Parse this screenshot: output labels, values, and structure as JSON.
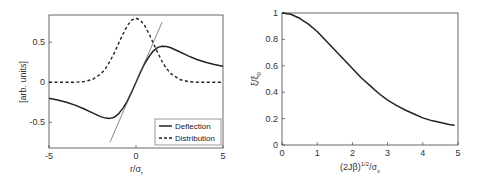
{
  "chart_data": [
    {
      "type": "line",
      "title": "",
      "xlabel": "r/σ_r",
      "xlabel_main": "r/σ",
      "xlabel_sub": "r",
      "ylabel": "[arb. units]",
      "xlim": [
        -5,
        5
      ],
      "ylim": [
        -0.82,
        0.84
      ],
      "xticks": [
        -5,
        0,
        5
      ],
      "xtick_labels": [
        "-5",
        "0",
        "5"
      ],
      "yticks": [
        -0.5,
        0,
        0.5
      ],
      "ytick_labels": [
        "-0.5",
        "0",
        "0.5"
      ],
      "grid": false,
      "legend_position": "bottom-right",
      "series": [
        {
          "name": "Deflection",
          "style": "solid",
          "color": "#222222",
          "x": [
            -5,
            -4.5,
            -4,
            -3.5,
            -3,
            -2.5,
            -2,
            -1.75,
            -1.5,
            -1.25,
            -1,
            -0.75,
            -0.5,
            -0.25,
            0,
            0.25,
            0.5,
            0.75,
            1,
            1.25,
            1.5,
            1.75,
            2,
            2.5,
            3,
            3.5,
            4,
            4.5,
            5
          ],
          "y": [
            -0.2,
            -0.222,
            -0.25,
            -0.284,
            -0.33,
            -0.382,
            -0.432,
            -0.447,
            -0.451,
            -0.435,
            -0.393,
            -0.322,
            -0.235,
            -0.124,
            0,
            0.124,
            0.235,
            0.322,
            0.393,
            0.435,
            0.451,
            0.447,
            0.432,
            0.382,
            0.33,
            0.284,
            0.25,
            0.222,
            0.2
          ]
        },
        {
          "name": "Distribution",
          "style": "dashed",
          "color": "#222222",
          "x": [
            -5,
            -4,
            -3.5,
            -3,
            -2.5,
            -2,
            -1.75,
            -1.5,
            -1.25,
            -1,
            -0.75,
            -0.5,
            -0.25,
            0,
            0.25,
            0.5,
            0.75,
            1,
            1.25,
            1.5,
            1.75,
            2,
            2.5,
            3,
            3.5,
            4,
            5
          ],
          "y": [
            0,
            0.0003,
            0.0017,
            0.0089,
            0.0351,
            0.1083,
            0.1735,
            0.2596,
            0.3664,
            0.4852,
            0.6031,
            0.706,
            0.7753,
            0.8,
            0.7753,
            0.706,
            0.6031,
            0.4852,
            0.3664,
            0.2596,
            0.1735,
            0.1083,
            0.0351,
            0.0089,
            0.0017,
            0.0003,
            0
          ]
        },
        {
          "name": "Tangent",
          "style": "thin",
          "color": "#555555",
          "x": [
            -1.5,
            1.5
          ],
          "y": [
            -0.75,
            0.75
          ],
          "in_legend": false
        }
      ],
      "legend": [
        "Deflection",
        "Distribution"
      ]
    },
    {
      "type": "line",
      "title": "",
      "xlabel": "(2Jβ)^{1/2}/σ_x",
      "xlabel_main": "(2Jβ)",
      "xlabel_sup": "1/2",
      "xlabel_tail": "/σ",
      "xlabel_sub": "x",
      "ylabel": "ξ/ξ_0",
      "ylabel_main": "ξ/ξ",
      "ylabel_sub": "0",
      "xlim": [
        0,
        5
      ],
      "ylim": [
        0,
        1
      ],
      "xticks": [
        0,
        1,
        2,
        3,
        4,
        5
      ],
      "xtick_labels": [
        "0",
        "1",
        "2",
        "3",
        "4",
        "5"
      ],
      "yticks": [
        0,
        0.2,
        0.4,
        0.6,
        0.8,
        1
      ],
      "ytick_labels": [
        "0",
        "0.2",
        "0.4",
        "0.6",
        "0.8",
        "1"
      ],
      "grid": false,
      "series": [
        {
          "name": "ξ/ξ0",
          "style": "solid",
          "color": "#222222",
          "x": [
            0,
            0.25,
            0.5,
            0.75,
            1,
            1.25,
            1.5,
            1.75,
            2,
            2.25,
            2.5,
            2.75,
            3,
            3.25,
            3.5,
            3.75,
            4,
            4.25,
            4.5,
            4.75,
            4.9
          ],
          "y": [
            1,
            0.99,
            0.96,
            0.915,
            0.86,
            0.79,
            0.72,
            0.65,
            0.58,
            0.51,
            0.45,
            0.39,
            0.34,
            0.3,
            0.265,
            0.235,
            0.205,
            0.185,
            0.17,
            0.155,
            0.15
          ]
        }
      ]
    }
  ]
}
